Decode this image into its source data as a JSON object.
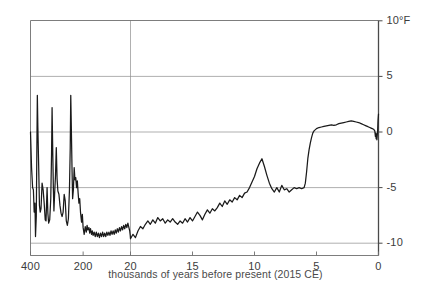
{
  "chart_data": {
    "type": "line",
    "title": "",
    "subtitle": "",
    "xlabel": "thousands of years before present (2015 CE)",
    "ylabel": "",
    "unit_label": "°F",
    "ylim": [
      -11.5,
      10
    ],
    "yticks": [
      10,
      5,
      0,
      -5,
      -10
    ],
    "ytick_labels": [
      "10",
      "5",
      "0",
      "-5",
      "-10"
    ],
    "grid": "horizontal-gridlines-plus-break-vertical",
    "legend": "none",
    "axis_note": "broken x-axis: compressed 400-20 kyr panel on left, expanded 20-0 kyr panel on right",
    "xticks": [
      400,
      200,
      20,
      15,
      10,
      5,
      0
    ],
    "xtick_labels": [
      "400",
      "200",
      "20",
      "15",
      "10",
      "5",
      "0"
    ],
    "break_at_kyr": 20,
    "series": [
      {
        "name": "reconstructed global temperature anomaly",
        "color": "#1a1a1a",
        "panel_left_points": [
          [
            400,
            0.0
          ],
          [
            396,
            -3.2
          ],
          [
            392,
            -5.0
          ],
          [
            389,
            -5.2
          ],
          [
            386,
            -7.2
          ],
          [
            383,
            -6.4
          ],
          [
            381,
            -9.4
          ],
          [
            378,
            -7.6
          ],
          [
            376,
            -2.0
          ],
          [
            374,
            3.3
          ],
          [
            372,
            0.4
          ],
          [
            369,
            -3.0
          ],
          [
            366,
            -6.6
          ],
          [
            363,
            -7.2
          ],
          [
            360,
            -6.9
          ],
          [
            356,
            -4.6
          ],
          [
            352,
            -5.2
          ],
          [
            348,
            -6.4
          ],
          [
            344,
            -7.9
          ],
          [
            341,
            -8.0
          ],
          [
            337,
            -5.0
          ],
          [
            334,
            -7.3
          ],
          [
            331,
            -8.2
          ],
          [
            327,
            -7.9
          ],
          [
            323,
            -6.0
          ],
          [
            320,
            -2.0
          ],
          [
            318,
            2.2
          ],
          [
            316,
            -1.0
          ],
          [
            313,
            -5.2
          ],
          [
            311,
            -7.1
          ],
          [
            308,
            -5.4
          ],
          [
            305,
            -3.9
          ],
          [
            302,
            -1.4
          ],
          [
            299,
            -4.2
          ],
          [
            296,
            -5.3
          ],
          [
            292,
            -5.6
          ],
          [
            288,
            -6.6
          ],
          [
            284,
            -7.3
          ],
          [
            280,
            -7.6
          ],
          [
            276,
            -7.2
          ],
          [
            272,
            -5.6
          ],
          [
            268,
            -6.2
          ],
          [
            264,
            -8.0
          ],
          [
            260,
            -8.4
          ],
          [
            256,
            -7.8
          ],
          [
            252,
            -5.2
          ],
          [
            249,
            -1.4
          ],
          [
            247,
            3.3
          ],
          [
            245,
            0.6
          ],
          [
            242,
            -3.6
          ],
          [
            240,
            -6.0
          ],
          [
            237,
            -5.2
          ],
          [
            234,
            -3.2
          ],
          [
            231,
            -4.3
          ],
          [
            228,
            -4.1
          ],
          [
            225,
            -5.0
          ],
          [
            222,
            -4.4
          ],
          [
            219,
            -5.5
          ],
          [
            216,
            -6.4
          ],
          [
            213,
            -6.0
          ],
          [
            210,
            -7.2
          ],
          [
            206,
            -8.1
          ],
          [
            203,
            -7.4
          ],
          [
            200,
            -8.6
          ],
          [
            196,
            -9.2
          ],
          [
            192,
            -8.5
          ],
          [
            188,
            -9.0
          ],
          [
            185,
            -8.4
          ],
          [
            182,
            -8.8
          ],
          [
            178,
            -8.6
          ],
          [
            175,
            -9.1
          ],
          [
            172,
            -8.7
          ],
          [
            168,
            -9.2
          ],
          [
            165,
            -8.9
          ],
          [
            162,
            -9.3
          ],
          [
            158,
            -9.0
          ],
          [
            154,
            -9.4
          ],
          [
            150,
            -9.0
          ],
          [
            146,
            -9.4
          ],
          [
            142,
            -9.1
          ],
          [
            138,
            -9.5
          ],
          [
            134,
            -9.1
          ],
          [
            130,
            -9.4
          ],
          [
            126,
            -9.0
          ],
          [
            122,
            -9.4
          ],
          [
            118,
            -9.1
          ],
          [
            114,
            -9.4
          ],
          [
            110,
            -9.0
          ],
          [
            106,
            -9.3
          ],
          [
            102,
            -9.0
          ],
          [
            98,
            -9.3
          ],
          [
            94,
            -8.9
          ],
          [
            90,
            -9.2
          ],
          [
            86,
            -8.9
          ],
          [
            82,
            -9.2
          ],
          [
            78,
            -8.8
          ],
          [
            74,
            -9.1
          ],
          [
            70,
            -8.7
          ],
          [
            66,
            -9.0
          ],
          [
            62,
            -8.6
          ],
          [
            58,
            -8.9
          ],
          [
            54,
            -8.5
          ],
          [
            50,
            -8.8
          ],
          [
            46,
            -8.4
          ],
          [
            42,
            -8.7
          ],
          [
            38,
            -8.3
          ],
          [
            34,
            -8.6
          ],
          [
            30,
            -8.2
          ],
          [
            26,
            -8.6
          ],
          [
            23,
            -8.9
          ],
          [
            21,
            -9.3
          ],
          [
            20,
            -9.6
          ]
        ],
        "panel_right_points": [
          [
            20.0,
            -9.6
          ],
          [
            19.8,
            -9.2
          ],
          [
            19.6,
            -9.5
          ],
          [
            19.4,
            -8.9
          ],
          [
            19.2,
            -8.5
          ],
          [
            19.0,
            -8.7
          ],
          [
            18.8,
            -8.3
          ],
          [
            18.6,
            -8.0
          ],
          [
            18.4,
            -8.3
          ],
          [
            18.2,
            -7.9
          ],
          [
            18.0,
            -8.2
          ],
          [
            17.8,
            -7.7
          ],
          [
            17.6,
            -8.0
          ],
          [
            17.4,
            -7.8
          ],
          [
            17.2,
            -8.2
          ],
          [
            17.0,
            -7.9
          ],
          [
            16.8,
            -8.1
          ],
          [
            16.6,
            -7.8
          ],
          [
            16.4,
            -8.1
          ],
          [
            16.2,
            -8.3
          ],
          [
            16.0,
            -8.0
          ],
          [
            15.8,
            -8.2
          ],
          [
            15.6,
            -7.8
          ],
          [
            15.4,
            -8.1
          ],
          [
            15.2,
            -7.7
          ],
          [
            15.0,
            -8.0
          ],
          [
            14.8,
            -7.6
          ],
          [
            14.6,
            -7.2
          ],
          [
            14.4,
            -7.5
          ],
          [
            14.2,
            -7.9
          ],
          [
            14.0,
            -7.4
          ],
          [
            13.8,
            -7.0
          ],
          [
            13.6,
            -7.3
          ],
          [
            13.4,
            -6.9
          ],
          [
            13.2,
            -7.1
          ],
          [
            13.0,
            -6.8
          ],
          [
            12.8,
            -6.4
          ],
          [
            12.6,
            -6.7
          ],
          [
            12.4,
            -6.2
          ],
          [
            12.2,
            -6.5
          ],
          [
            12.0,
            -6.1
          ],
          [
            11.8,
            -6.3
          ],
          [
            11.6,
            -5.9
          ],
          [
            11.4,
            -6.1
          ],
          [
            11.2,
            -5.7
          ],
          [
            11.0,
            -5.9
          ],
          [
            10.8,
            -5.5
          ],
          [
            10.6,
            -5.4
          ],
          [
            10.4,
            -5.0
          ],
          [
            10.2,
            -4.5
          ],
          [
            10.0,
            -4.0
          ],
          [
            9.8,
            -3.3
          ],
          [
            9.6,
            -2.8
          ],
          [
            9.4,
            -2.4
          ],
          [
            9.2,
            -3.1
          ],
          [
            9.0,
            -3.9
          ],
          [
            8.8,
            -4.6
          ],
          [
            8.6,
            -5.1
          ],
          [
            8.4,
            -5.4
          ],
          [
            8.2,
            -5.0
          ],
          [
            8.0,
            -5.4
          ],
          [
            7.8,
            -4.8
          ],
          [
            7.6,
            -5.2
          ],
          [
            7.4,
            -5.1
          ],
          [
            7.2,
            -5.4
          ],
          [
            7.0,
            -5.2
          ],
          [
            6.8,
            -5.0
          ],
          [
            6.6,
            -5.1
          ],
          [
            6.4,
            -5.0
          ],
          [
            6.2,
            -5.1
          ],
          [
            6.0,
            -5.0
          ],
          [
            5.9,
            -4.6
          ],
          [
            5.8,
            -3.6
          ],
          [
            5.7,
            -2.4
          ],
          [
            5.6,
            -1.6
          ],
          [
            5.5,
            -1.0
          ],
          [
            5.4,
            -0.5
          ],
          [
            5.3,
            -0.1
          ],
          [
            5.2,
            0.1
          ],
          [
            5.0,
            0.3
          ],
          [
            4.8,
            0.4
          ],
          [
            4.6,
            0.45
          ],
          [
            4.4,
            0.5
          ],
          [
            4.2,
            0.55
          ],
          [
            4.0,
            0.6
          ],
          [
            3.8,
            0.65
          ],
          [
            3.6,
            0.6
          ],
          [
            3.4,
            0.65
          ],
          [
            3.2,
            0.75
          ],
          [
            3.0,
            0.8
          ],
          [
            2.8,
            0.85
          ],
          [
            2.6,
            0.9
          ],
          [
            2.4,
            0.95
          ],
          [
            2.2,
            1.0
          ],
          [
            2.0,
            0.95
          ],
          [
            1.8,
            0.9
          ],
          [
            1.6,
            0.85
          ],
          [
            1.4,
            0.75
          ],
          [
            1.2,
            0.65
          ],
          [
            1.0,
            0.55
          ],
          [
            0.9,
            0.5
          ],
          [
            0.8,
            0.45
          ],
          [
            0.7,
            0.4
          ],
          [
            0.6,
            0.35
          ],
          [
            0.5,
            0.3
          ],
          [
            0.4,
            0.25
          ],
          [
            0.3,
            0.1
          ],
          [
            0.25,
            -0.4
          ],
          [
            0.22,
            -0.1
          ],
          [
            0.19,
            -0.6
          ],
          [
            0.16,
            -0.2
          ],
          [
            0.13,
            -0.7
          ],
          [
            0.1,
            -0.3
          ],
          [
            0.07,
            0.1
          ],
          [
            0.04,
            1.0
          ],
          [
            0.0,
            1.6
          ]
        ]
      }
    ],
    "annotations": []
  }
}
